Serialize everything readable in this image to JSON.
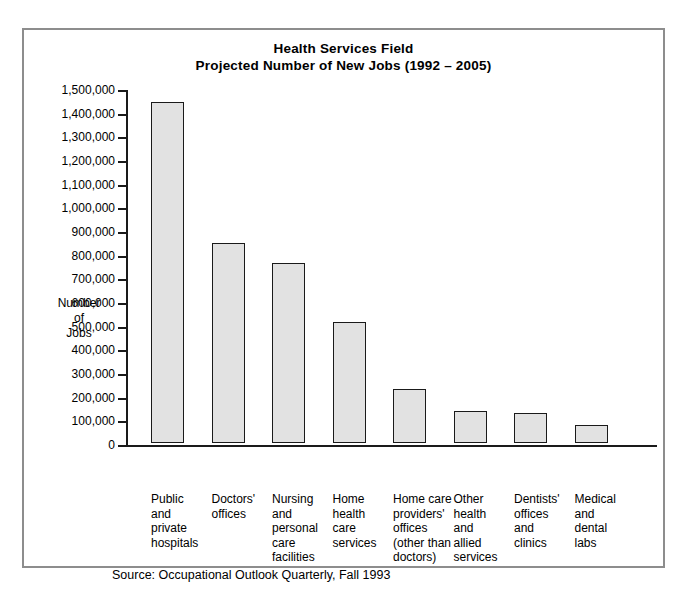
{
  "chart_data": {
    "type": "bar",
    "title": "Health Services Field",
    "subtitle": "Projected Number of New Jobs (1992 – 2005)",
    "xlabel": "",
    "ylabel": "Number of Jobs",
    "ylim": [
      0,
      1500000
    ],
    "grid": false,
    "legend": null,
    "categories": [
      "Public and private hospitals",
      "Doctors' offices",
      "Nursing and personal care facilities",
      "Home health care services",
      "Home care providers' offices (other than doctors)",
      "Other health and allied services",
      "Dentists' offices and clinics",
      "Medical and dental labs"
    ],
    "category_lines": [
      [
        "Public",
        "and",
        "private",
        "hospitals"
      ],
      [
        "Doctors'",
        "offices"
      ],
      [
        "Nursing",
        "and",
        "personal",
        "care",
        "facilities"
      ],
      [
        "Home",
        "health",
        "care",
        "services"
      ],
      [
        "Home care",
        "providers'",
        "offices",
        "(other than",
        "doctors)"
      ],
      [
        "Other",
        "health",
        "and",
        "allied",
        "services"
      ],
      [
        "Dentists'",
        "offices",
        "and",
        "clinics"
      ],
      [
        "Medical",
        "and",
        "dental",
        "labs"
      ]
    ],
    "values": [
      1440000,
      845000,
      760000,
      510000,
      230000,
      135000,
      125000,
      75000
    ],
    "ytick_values": [
      0,
      100000,
      200000,
      300000,
      400000,
      500000,
      600000,
      700000,
      800000,
      900000,
      1000000,
      1100000,
      1200000,
      1300000,
      1400000,
      1500000
    ],
    "ytick_labels": [
      "0",
      "100,000",
      "200,000",
      "300,000",
      "400,000",
      "500,000",
      "600,000",
      "700,000",
      "800,000",
      "900,000",
      "1,000,000",
      "1,100,000",
      "1,200,000",
      "1,300,000",
      "1,400,000",
      "1,500,000"
    ],
    "bar_fill_color": "#e2e2e2",
    "bar_border_color": "#1a1a1a",
    "axis_color": "#1a1a1a",
    "frame_color": "#8d8d8d",
    "background_color": "#ffffff"
  },
  "y_axis_title_lines": [
    "Number",
    "of",
    "Jobs"
  ],
  "source": "Source: Occupational Outlook Quarterly, Fall 1993"
}
